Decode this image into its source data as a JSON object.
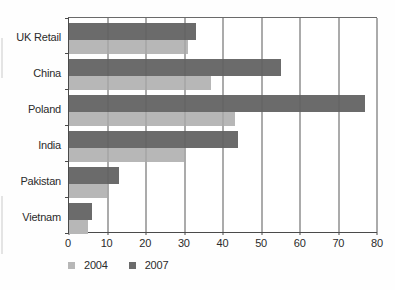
{
  "chart_data": {
    "type": "bar",
    "orientation": "horizontal",
    "title": "",
    "categories": [
      "UK Retail",
      "China",
      "Poland",
      "India",
      "Pakistan",
      "Vietnam"
    ],
    "series": [
      {
        "name": "2004",
        "color": "#b7b7b7",
        "values": [
          31,
          37,
          43,
          30,
          10,
          5
        ]
      },
      {
        "name": "2007",
        "color": "#6b6b6b",
        "values": [
          33,
          55,
          77,
          44,
          13,
          6
        ]
      }
    ],
    "xlim": [
      0,
      80
    ],
    "xticks": [
      0,
      10,
      20,
      30,
      40,
      50,
      60,
      70,
      80
    ],
    "x_tick_labels": [
      "0",
      "10",
      "20",
      "30",
      "40",
      "50",
      "60",
      "70",
      "80"
    ],
    "grid": true,
    "legend_position": "bottom-left",
    "group_order_top_to_bottom": [
      "2007",
      "2004"
    ]
  },
  "colors": {
    "background": "#ffffff",
    "axis": "#4a4a4a",
    "gridline": "#757575",
    "text": "#2b2b2b",
    "bar_2004": "#b7b7b7",
    "bar_2007": "#6b6b6b"
  }
}
